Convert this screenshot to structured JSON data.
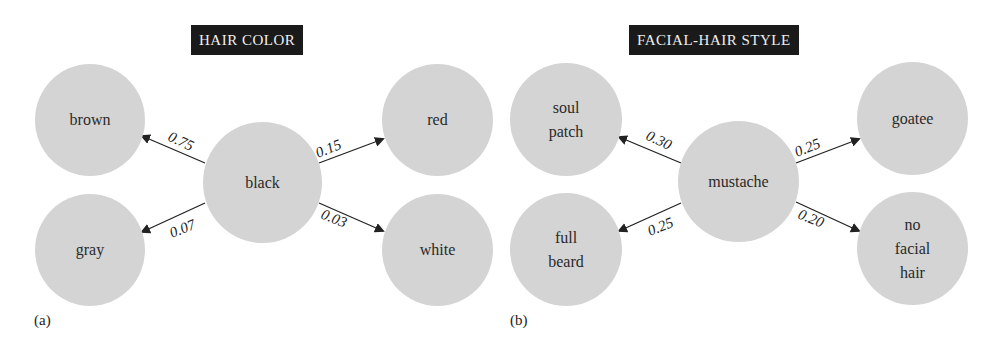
{
  "panels": [
    {
      "id": "a",
      "panel_label": "(a)",
      "title": "HAIR COLOR",
      "center": {
        "label": "black"
      },
      "nodes": [
        {
          "label": "brown",
          "probability": "0.75"
        },
        {
          "label": "red",
          "probability": "0.15"
        },
        {
          "label": "gray",
          "probability": "0.07"
        },
        {
          "label": "white",
          "probability": "0.03"
        }
      ]
    },
    {
      "id": "b",
      "panel_label": "(b)",
      "title": "FACIAL-HAIR STYLE",
      "center": {
        "label": "mustache"
      },
      "nodes": [
        {
          "label": "soul\npatch",
          "probability": "0.30"
        },
        {
          "label": "goatee",
          "probability": "0.25"
        },
        {
          "label": "full\nbeard",
          "probability": "0.25"
        },
        {
          "label": "no\nfacial\nhair",
          "probability": "0.20"
        }
      ]
    }
  ],
  "colors": {
    "node_fill": "#d4d4d4",
    "title_bg": "#1a1a1a",
    "title_text": "#f0f0f0",
    "edge": "#222222"
  }
}
